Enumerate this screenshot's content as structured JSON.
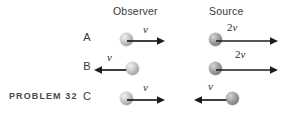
{
  "figure": {
    "problem_label": "PROBLEM 32",
    "columns": {
      "observer": "Observer",
      "source": "Source"
    },
    "rows": [
      {
        "letter": "A",
        "observer": {
          "speed_label": "v",
          "speed_number": "",
          "direction": "right"
        },
        "source": {
          "speed_label": "v",
          "speed_number": "2",
          "direction": "right"
        }
      },
      {
        "letter": "B",
        "observer": {
          "speed_label": "v",
          "speed_number": "",
          "direction": "left"
        },
        "source": {
          "speed_label": "v",
          "speed_number": "2",
          "direction": "right"
        }
      },
      {
        "letter": "C",
        "observer": {
          "speed_label": "v",
          "speed_number": "",
          "direction": "right"
        },
        "source": {
          "speed_label": "v",
          "speed_number": "",
          "direction": "left"
        }
      }
    ],
    "colors": {
      "background": "#ffffff",
      "text": "#3a3a3a",
      "arrow": "#1c1c1c",
      "ball_light": "#bdbdbd",
      "ball_dark": "#9b9b9b"
    }
  }
}
